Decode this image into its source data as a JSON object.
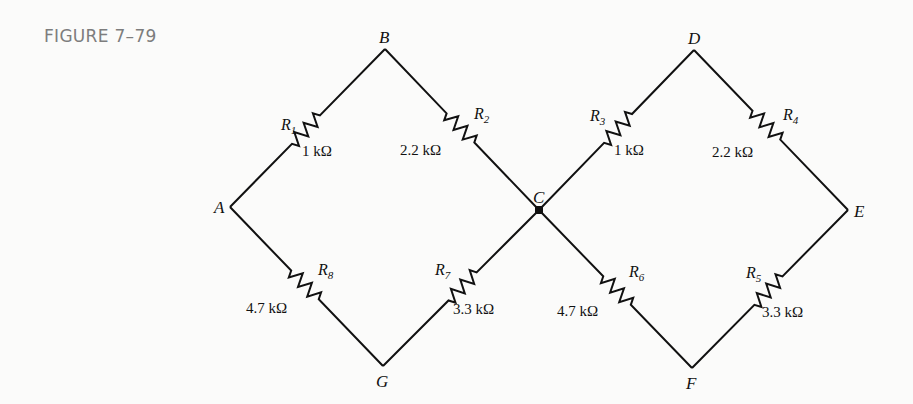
{
  "figure": {
    "label": "FIGURE 7–79"
  },
  "nodes": [
    {
      "id": "A",
      "label": "A",
      "x": 230,
      "y": 207,
      "lx": 214,
      "ly": 213
    },
    {
      "id": "B",
      "label": "B",
      "x": 385,
      "y": 49,
      "lx": 379,
      "ly": 43
    },
    {
      "id": "C",
      "label": "C",
      "x": 539,
      "y": 210,
      "lx": 533,
      "ly": 203,
      "junction": true
    },
    {
      "id": "D",
      "label": "D",
      "x": 694,
      "y": 50,
      "lx": 688,
      "ly": 44
    },
    {
      "id": "E",
      "label": "E",
      "x": 848,
      "y": 210,
      "lx": 854,
      "ly": 217
    },
    {
      "id": "F",
      "label": "F",
      "x": 692,
      "y": 368,
      "lx": 686,
      "ly": 389
    },
    {
      "id": "G",
      "label": "G",
      "x": 383,
      "y": 366,
      "lx": 376,
      "ly": 387
    }
  ],
  "resistors": [
    {
      "name": "R",
      "sub": "1",
      "value": "1 kΩ",
      "from": "A",
      "to": "B",
      "t0": 0.4,
      "t1": 0.58,
      "nx": 281,
      "ny": 130,
      "vx": 302,
      "vy": 156
    },
    {
      "name": "R",
      "sub": "2",
      "value": "2.2 kΩ",
      "from": "B",
      "to": "C",
      "t0": 0.4,
      "t1": 0.58,
      "nx": 474,
      "ny": 119,
      "vx": 400,
      "vy": 155
    },
    {
      "name": "R",
      "sub": "3",
      "value": "1 kΩ",
      "from": "C",
      "to": "D",
      "t0": 0.42,
      "t1": 0.6,
      "nx": 590,
      "ny": 121,
      "vx": 614,
      "vy": 155
    },
    {
      "name": "R",
      "sub": "4",
      "value": "2.2 kΩ",
      "from": "D",
      "to": "E",
      "t0": 0.38,
      "t1": 0.56,
      "nx": 783,
      "ny": 120,
      "vx": 712,
      "vy": 157
    },
    {
      "name": "R",
      "sub": "5",
      "value": "3.3 kΩ",
      "from": "F",
      "to": "E",
      "t0": 0.4,
      "t1": 0.58,
      "nx": 746,
      "ny": 278,
      "vx": 762,
      "vy": 317
    },
    {
      "name": "R",
      "sub": "6",
      "value": "4.7 kΩ",
      "from": "C",
      "to": "F",
      "t0": 0.42,
      "t1": 0.6,
      "nx": 629,
      "ny": 277,
      "vx": 557,
      "vy": 316
    },
    {
      "name": "R",
      "sub": "7",
      "value": "3.3 kΩ",
      "from": "G",
      "to": "C",
      "t0": 0.42,
      "t1": 0.6,
      "nx": 435,
      "ny": 275,
      "vx": 453,
      "vy": 314
    },
    {
      "name": "R",
      "sub": "8",
      "value": "4.7 kΩ",
      "from": "A",
      "to": "G",
      "t0": 0.4,
      "t1": 0.58,
      "nx": 318,
      "ny": 275,
      "vx": 246,
      "vy": 313
    }
  ],
  "colors": {
    "wire": "#111111",
    "figure_label": "#7d7d7d",
    "background": "#fbfbfa"
  }
}
